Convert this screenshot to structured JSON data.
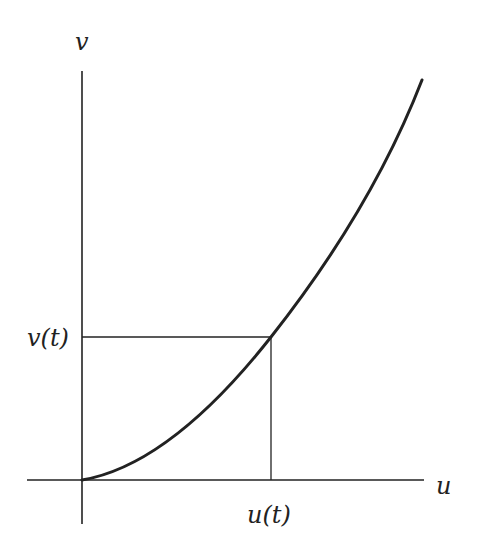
{
  "diagram": {
    "labels": {
      "v_axis": "v",
      "u_axis": "u",
      "v_t": "v(t)",
      "u_t": "u(t)"
    },
    "colors": {
      "stroke": "#222222",
      "background": "#ffffff"
    },
    "elements": {
      "horizontal_axis": "u-axis",
      "vertical_axis": "v-axis",
      "curve": "increasing convex curve from origin",
      "projection_lines": "rectangle from origin to point (u(t), v(t))"
    }
  }
}
